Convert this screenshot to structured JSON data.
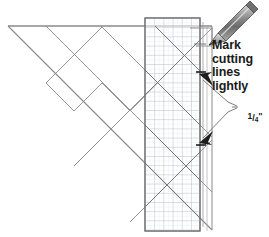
{
  "figure": {
    "kind": "instructional-diagram",
    "background_color": "#ffffff",
    "line_color": "#6e6e6e",
    "dark_line_color": "#3a3a3a",
    "grid_color": "#b9c4cf",
    "grid_fine_color": "#d8dde3",
    "ink_color": "#1a1a1a"
  },
  "annotations": {
    "mark_note": "Mark\ncutting\nlines\nlightly",
    "dimension": {
      "numerator": "1",
      "slash": "/",
      "denominator": "4",
      "inch_mark": "\""
    }
  },
  "icons": {
    "pencil": "pencil-icon",
    "arrow_upper": "arrowhead-icon",
    "arrow_lower": "arrowhead-icon",
    "tick_upper": "tick-mark-icon",
    "tick_lower": "tick-mark-icon"
  },
  "ruler": {
    "x": 145,
    "y": 18,
    "width": 55,
    "height": 213,
    "grid_step": 9.2,
    "fine_step": 4.6
  },
  "pencil": {
    "tip_x": 208,
    "tip_y": 44,
    "end_x": 248,
    "end_y": 6
  }
}
